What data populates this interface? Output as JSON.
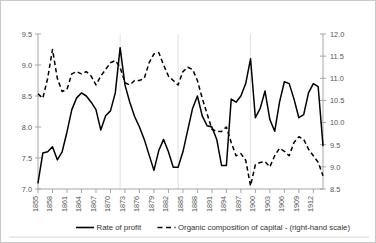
{
  "chart_data": {
    "type": "line",
    "title": "",
    "xlabel": "",
    "ylabel": "",
    "grid": "vertical-sparse",
    "legend_position": "bottom",
    "x": [
      1855,
      1856,
      1857,
      1858,
      1859,
      1860,
      1861,
      1862,
      1863,
      1864,
      1865,
      1866,
      1867,
      1868,
      1869,
      1870,
      1871,
      1872,
      1873,
      1874,
      1875,
      1876,
      1877,
      1878,
      1879,
      1880,
      1881,
      1882,
      1883,
      1884,
      1885,
      1886,
      1887,
      1888,
      1889,
      1890,
      1891,
      1892,
      1893,
      1894,
      1895,
      1896,
      1897,
      1898,
      1899,
      1900,
      1901,
      1902,
      1903,
      1904,
      1905,
      1906,
      1907,
      1908,
      1909,
      1910,
      1911,
      1912,
      1913,
      1914
    ],
    "xtick_labels": [
      "1855",
      "1858",
      "1861",
      "1864",
      "1867",
      "1870",
      "1873",
      "1876",
      "1879",
      "1882",
      "1885",
      "1888",
      "1891",
      "1894",
      "1897",
      "1900",
      "1903",
      "1906",
      "1909",
      "1912"
    ],
    "axes": {
      "left": {
        "name": "Rate of profit",
        "ticks": [
          "9.5",
          "9.0",
          "8.5",
          "8.0",
          "7.5",
          "7.0"
        ],
        "tick_values": [
          9.5,
          9.0,
          8.5,
          8.0,
          7.5,
          7.0
        ],
        "ylim": [
          7.0,
          9.5
        ]
      },
      "right": {
        "name": "Organic composition of capital",
        "ticks": [
          "12.0",
          "11.5",
          "11.0",
          "10.5",
          "10.0",
          "9.5",
          "9.0",
          "8.5"
        ],
        "tick_values": [
          12.0,
          11.5,
          11.0,
          10.5,
          10.0,
          9.5,
          9.0,
          8.5
        ],
        "ylim": [
          8.5,
          12.0
        ]
      }
    },
    "gridline_years": [
      1872,
      1884,
      1899
    ],
    "series": [
      {
        "name": "Rate of profit",
        "label": "Rate of profit",
        "style": "solid",
        "axis": "left",
        "color": "#000000",
        "values": [
          7.1,
          7.58,
          7.6,
          7.68,
          7.47,
          7.6,
          7.92,
          8.28,
          8.47,
          8.55,
          8.5,
          8.4,
          8.28,
          7.95,
          8.18,
          8.26,
          8.55,
          9.28,
          8.68,
          8.4,
          8.17,
          8.0,
          7.8,
          7.55,
          7.3,
          7.62,
          7.8,
          7.6,
          7.35,
          7.35,
          7.6,
          7.95,
          8.3,
          8.5,
          8.18,
          8.02,
          8.0,
          7.8,
          7.38,
          7.38,
          8.45,
          8.4,
          8.5,
          8.7,
          9.1,
          8.15,
          8.3,
          8.58,
          8.12,
          7.93,
          8.4,
          8.73,
          8.7,
          8.45,
          8.15,
          8.2,
          8.55,
          8.7,
          8.65,
          7.7
        ]
      },
      {
        "name": "Organic composition of capital",
        "label": "Organic composition of capital - (right-hand scale)",
        "style": "dashed",
        "axis": "right",
        "color": "#000000",
        "values": [
          10.65,
          10.55,
          11.0,
          11.65,
          11.0,
          10.7,
          10.75,
          11.1,
          11.15,
          11.1,
          11.15,
          11.05,
          10.85,
          11.05,
          11.2,
          11.35,
          11.4,
          11.25,
          10.9,
          10.85,
          10.95,
          10.95,
          11.0,
          11.35,
          11.55,
          11.58,
          11.3,
          11.05,
          10.95,
          10.85,
          11.15,
          11.25,
          11.2,
          10.95,
          10.55,
          10.2,
          9.85,
          9.8,
          9.8,
          9.9,
          9.55,
          9.25,
          9.3,
          9.15,
          8.57,
          9.05,
          9.1,
          9.12,
          9.0,
          9.25,
          9.42,
          9.35,
          9.25,
          9.55,
          9.68,
          9.62,
          9.4,
          9.25,
          9.1,
          8.8
        ]
      }
    ]
  },
  "legend": {
    "items": [
      {
        "label": "Rate of profit",
        "style": "solid"
      },
      {
        "label": "Organic composition of capital - (right-hand scale)",
        "style": "dashed"
      }
    ]
  }
}
